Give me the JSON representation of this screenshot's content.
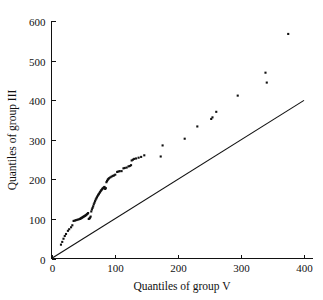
{
  "chart_data": {
    "type": "scatter",
    "title": "",
    "subtitle": "",
    "xlabel": "Quantiles of group V",
    "ylabel": "Quantiles of group III",
    "xlim": [
      0,
      400
    ],
    "ylim": [
      0,
      600
    ],
    "xticks": [
      0,
      100,
      200,
      300,
      400
    ],
    "yticks": [
      0,
      100,
      200,
      300,
      400,
      500,
      600
    ],
    "xtick_labels": [
      "0",
      "100",
      "200",
      "300",
      "400"
    ],
    "ytick_labels": [
      "0",
      "100",
      "200",
      "300",
      "400",
      "500",
      "600"
    ],
    "grid": false,
    "legend": null,
    "legend_position": "none",
    "annotations": [],
    "marker": "square-dot",
    "marker_color": "#111111",
    "marker_size_px": 2.1,
    "series": [
      {
        "name": "Q-Q points",
        "points": [
          [
            15,
            35
          ],
          [
            17,
            42
          ],
          [
            19,
            50
          ],
          [
            21,
            57
          ],
          [
            23,
            62
          ],
          [
            26,
            70
          ],
          [
            28,
            74
          ],
          [
            31,
            79
          ],
          [
            33,
            84
          ],
          [
            35,
            95
          ],
          [
            37,
            96
          ],
          [
            39,
            97
          ],
          [
            41,
            98
          ],
          [
            43,
            99
          ],
          [
            45,
            100
          ],
          [
            46,
            101
          ],
          [
            47,
            102
          ],
          [
            48,
            103
          ],
          [
            49,
            104
          ],
          [
            50,
            105
          ],
          [
            51,
            106
          ],
          [
            52,
            107
          ],
          [
            53,
            108
          ],
          [
            54,
            109
          ],
          [
            55,
            110
          ],
          [
            56,
            112
          ],
          [
            57,
            113
          ],
          [
            58,
            115
          ],
          [
            59,
            100
          ],
          [
            60,
            101
          ],
          [
            61,
            103
          ],
          [
            62,
            106
          ],
          [
            63,
            119
          ],
          [
            64,
            124
          ],
          [
            65,
            128
          ],
          [
            66,
            132
          ],
          [
            67,
            137
          ],
          [
            68,
            141
          ],
          [
            69,
            145
          ],
          [
            70,
            149
          ],
          [
            71,
            152
          ],
          [
            72,
            155
          ],
          [
            73,
            158
          ],
          [
            74,
            161
          ],
          [
            75,
            163
          ],
          [
            76,
            166
          ],
          [
            77,
            168
          ],
          [
            78,
            171
          ],
          [
            79,
            173
          ],
          [
            80,
            175
          ],
          [
            81,
            177
          ],
          [
            82,
            178
          ],
          [
            83,
            180
          ],
          [
            84,
            181
          ],
          [
            85,
            176
          ],
          [
            86,
            178
          ],
          [
            87,
            193
          ],
          [
            88,
            196
          ],
          [
            89,
            199
          ],
          [
            90,
            201
          ],
          [
            91,
            203
          ],
          [
            93,
            205
          ],
          [
            95,
            207
          ],
          [
            97,
            209
          ],
          [
            99,
            210
          ],
          [
            101,
            212
          ],
          [
            104,
            219
          ],
          [
            106,
            220
          ],
          [
            108,
            221
          ],
          [
            111,
            221
          ],
          [
            114,
            228
          ],
          [
            116,
            229
          ],
          [
            119,
            230
          ],
          [
            122,
            233
          ],
          [
            124,
            234
          ],
          [
            126,
            236
          ],
          [
            127,
            248
          ],
          [
            129,
            250
          ],
          [
            131,
            252
          ],
          [
            134,
            253
          ],
          [
            138,
            255
          ],
          [
            142,
            257
          ],
          [
            147,
            261
          ],
          [
            173,
            258
          ],
          [
            176,
            286
          ],
          [
            211,
            303
          ],
          [
            231,
            334
          ],
          [
            253,
            353
          ],
          [
            255,
            357
          ],
          [
            261,
            371
          ],
          [
            295,
            412
          ],
          [
            339,
            470
          ],
          [
            341,
            445
          ],
          [
            375,
            568
          ]
        ]
      }
    ],
    "reference_line": {
      "name": "y = x",
      "from": [
        0,
        0
      ],
      "to": [
        400,
        400
      ]
    }
  },
  "axes": {
    "x_axis_name": "x-axis",
    "y_axis_name": "y-axis"
  }
}
